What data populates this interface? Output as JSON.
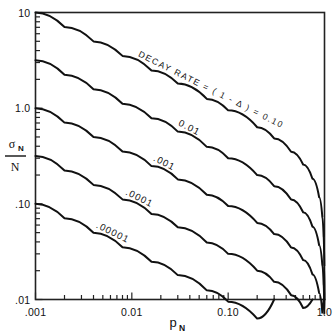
{
  "chart_data": {
    "type": "line",
    "title": "",
    "xlabel": "p_N",
    "ylabel": "sigma_N / N",
    "xscale": "log",
    "yscale": "log",
    "xlim": [
      0.001,
      1.0
    ],
    "ylim": [
      0.01,
      10
    ],
    "grid": false,
    "legend_position": "inline-curve-labels",
    "x_tick_labels": [
      ".001",
      "0.01",
      "0.10",
      "1.0"
    ],
    "x_tick_values": [
      0.001,
      0.01,
      0.1,
      1.0
    ],
    "y_tick_labels": [
      "10",
      "1.0",
      ".10",
      ".01"
    ],
    "y_tick_values": [
      10,
      1.0,
      0.1,
      0.01
    ],
    "annotations": [
      {
        "text": "DECAY RATE = ( 1 - Δ ) = 0.10",
        "curve": 0
      }
    ],
    "series": [
      {
        "name": "0.10",
        "label": "DECAY RATE = ( 1 - Δ ) = 0.10",
        "x": [
          0.001,
          0.002,
          0.004,
          0.008,
          0.016,
          0.03,
          0.06,
          0.1,
          0.2,
          0.3,
          0.45,
          0.6,
          0.75,
          0.88,
          0.95,
          0.98,
          0.995,
          1.0
        ],
        "y": [
          9.995,
          7.06,
          4.99,
          3.52,
          2.48,
          1.81,
          1.25,
          0.949,
          0.632,
          0.483,
          0.35,
          0.258,
          0.183,
          0.117,
          0.0725,
          0.0452,
          0.0224,
          0.01
        ]
      },
      {
        "name": "0.01",
        "label": "0.01",
        "x": [
          0.001,
          0.002,
          0.004,
          0.008,
          0.016,
          0.03,
          0.06,
          0.1,
          0.2,
          0.3,
          0.45,
          0.6,
          0.75,
          0.88,
          0.95,
          0.98,
          0.995,
          1.0
        ],
        "y": [
          3.161,
          2.233,
          1.578,
          1.113,
          0.784,
          0.569,
          0.394,
          0.3,
          0.2,
          0.153,
          0.111,
          0.0816,
          0.0577,
          0.0369,
          0.0229,
          0.0143,
          0.00709,
          0.0032
        ]
      },
      {
        "name": ".001",
        "label": ".001",
        "x": [
          0.001,
          0.002,
          0.004,
          0.008,
          0.016,
          0.03,
          0.06,
          0.1,
          0.2,
          0.3,
          0.45,
          0.6,
          0.75,
          0.88,
          0.95,
          0.98,
          0.995,
          1.0
        ],
        "y": [
          0.9995,
          0.7062,
          0.499,
          0.3519,
          0.2479,
          0.18,
          0.1246,
          0.0949,
          0.0632,
          0.0483,
          0.035,
          0.0258,
          0.0183,
          0.0117,
          0.00725,
          0.00452,
          0.00224,
          0.001
        ]
      },
      {
        "name": ".0001",
        "label": ".0001",
        "x": [
          0.001,
          0.002,
          0.004,
          0.008,
          0.016,
          0.03,
          0.06,
          0.1,
          0.2,
          0.3,
          0.45,
          0.6,
          0.75,
          0.88,
          0.95,
          0.98,
          0.995,
          1.0
        ],
        "y": [
          0.3161,
          0.2233,
          0.1578,
          0.1113,
          0.0784,
          0.0569,
          0.0394,
          0.03,
          0.02,
          0.0153,
          0.0111,
          0.00816,
          0.00577,
          0.00369,
          0.00229,
          0.00143,
          0.000709,
          0.00032
        ]
      },
      {
        "name": ".00001",
        "label": ".00001",
        "x": [
          0.001,
          0.002,
          0.004,
          0.008,
          0.016,
          0.03,
          0.06,
          0.1,
          0.2,
          0.3,
          0.45,
          0.6,
          0.75,
          0.88,
          0.95,
          0.98,
          0.995,
          1.0
        ],
        "y": [
          0.09995,
          0.07062,
          0.0499,
          0.03519,
          0.02479,
          0.018,
          0.01246,
          0.00949,
          0.00632,
          0.00483,
          0.0035,
          0.00258,
          0.00183,
          0.00117,
          0.000725,
          0.000452,
          0.000224,
          0.0001
        ]
      }
    ]
  },
  "axes": {
    "x_title": "p",
    "x_title_sub": "N",
    "y_title_numerator": "σ",
    "y_title_numerator_sub": "N",
    "y_title_denominator": "N"
  },
  "style": {
    "line_color": "#111111",
    "frame_color": "#222222",
    "background": "#ffffff"
  }
}
